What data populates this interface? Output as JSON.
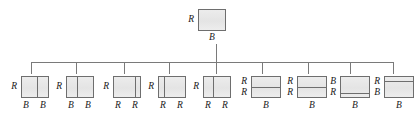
{
  "figure": {
    "type": "tree-diagram",
    "background_color": "#ffffff",
    "box_fill": "#e9e9e9",
    "box_border": "#6e6e6e",
    "line_color": "#7a7a7a",
    "root": {
      "left_label": "R",
      "bottom_label": "B",
      "x": 198,
      "y": 9,
      "w": 28,
      "h": 22,
      "dividers": []
    },
    "children": [
      {
        "id": "child-1",
        "left_labels": [
          "R"
        ],
        "bottom_labels": [
          "B",
          "B"
        ],
        "x": 21,
        "y": 76,
        "w": 28,
        "h": 22,
        "divider_type": "vertical",
        "divider_pos": 0.57,
        "drop_x": 31
      },
      {
        "id": "child-2",
        "left_labels": [
          "R"
        ],
        "bottom_labels": [
          "B",
          "B"
        ],
        "x": 66,
        "y": 76,
        "w": 28,
        "h": 22,
        "divider_type": "vertical",
        "divider_pos": 0.38,
        "drop_x": 76
      },
      {
        "id": "child-3",
        "left_labels": [
          "R"
        ],
        "bottom_labels": [
          "R",
          "R"
        ],
        "x": 113,
        "y": 76,
        "w": 28,
        "h": 22,
        "divider_type": "vertical",
        "divider_pos": 0.82,
        "drop_x": 124
      },
      {
        "id": "child-4",
        "left_labels": [
          "R"
        ],
        "bottom_labels": [
          "R",
          "R"
        ],
        "x": 158,
        "y": 76,
        "w": 28,
        "h": 22,
        "divider_type": "vertical",
        "divider_pos": 0.18,
        "drop_x": 169
      },
      {
        "id": "child-5",
        "left_labels": [
          "R"
        ],
        "bottom_labels": [
          "R",
          "R"
        ],
        "x": 203,
        "y": 76,
        "w": 28,
        "h": 22,
        "divider_type": "vertical",
        "divider_pos": 0.36,
        "drop_x": 216
      },
      {
        "id": "child-6",
        "left_labels": [
          "R",
          "R"
        ],
        "bottom_labels": [
          "B"
        ],
        "x": 251,
        "y": 76,
        "w": 30,
        "h": 22,
        "divider_type": "horizontal",
        "divider_pos": 0.5,
        "drop_x": 262
      },
      {
        "id": "child-7",
        "left_labels": [
          "R",
          "R"
        ],
        "bottom_labels": [
          "B"
        ],
        "x": 297,
        "y": 76,
        "w": 30,
        "h": 22,
        "divider_type": "horizontal",
        "divider_pos": 0.5,
        "drop_x": 308
      },
      {
        "id": "child-8",
        "left_labels": [
          "B",
          "R"
        ],
        "bottom_labels": [
          "B"
        ],
        "x": 340,
        "y": 76,
        "w": 30,
        "h": 22,
        "divider_type": "horizontal",
        "divider_pos": 0.78,
        "drop_x": 350
      },
      {
        "id": "child-9",
        "left_labels": [
          "R",
          "B"
        ],
        "bottom_labels": [
          "B"
        ],
        "x": 384,
        "y": 76,
        "w": 30,
        "h": 22,
        "divider_type": "horizontal",
        "divider_pos": 0.22,
        "drop_x": 393
      }
    ],
    "connectors": {
      "root_stem_x": 216,
      "root_stem_top": 44,
      "root_stem_bottom": 62,
      "bus_y": 62,
      "bus_left": 31,
      "bus_right": 393,
      "drop_bottom": 74
    }
  }
}
